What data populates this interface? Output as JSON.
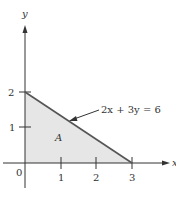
{
  "diagram": {
    "axes": {
      "x_label": "x",
      "y_label": "y",
      "origin_label": "0",
      "x_ticks": [
        "1",
        "2",
        "3"
      ],
      "y_ticks": [
        "1",
        "2"
      ]
    },
    "line": {
      "equation_label": "2x + 3y = 6",
      "from": [
        0,
        2
      ],
      "to": [
        3,
        0
      ]
    },
    "region": {
      "label": "A",
      "vertices": [
        [
          0,
          0
        ],
        [
          0,
          2
        ],
        [
          3,
          0
        ]
      ]
    },
    "colors": {
      "axis": "#333333",
      "line": "#555555",
      "fill": "#e6e6e6"
    }
  }
}
